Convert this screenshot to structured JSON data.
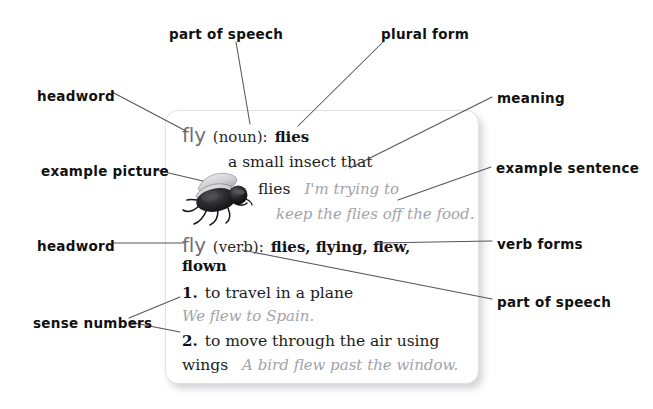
{
  "diagram": {
    "background_color": "#ffffff",
    "line_color": "#55555c"
  },
  "annotations": [
    {
      "id": "part-of-speech-top",
      "label": "part of speech",
      "x": 169,
      "y": 28
    },
    {
      "id": "plural-form",
      "label": "plural form",
      "x": 381,
      "y": 28
    },
    {
      "id": "headword-noun",
      "label": "headword",
      "x": 37,
      "y": 90
    },
    {
      "id": "meaning",
      "label": "meaning",
      "x": 497,
      "y": 92
    },
    {
      "id": "example-picture",
      "label": "example picture",
      "x": 41,
      "y": 165
    },
    {
      "id": "example-sentence",
      "label": "example sentence",
      "x": 496,
      "y": 162
    },
    {
      "id": "headword-verb",
      "label": "headword",
      "x": 37,
      "y": 240
    },
    {
      "id": "verb-forms",
      "label": "verb forms",
      "x": 497,
      "y": 238
    },
    {
      "id": "part-of-speech-right",
      "label": "part of speech",
      "x": 497,
      "y": 296
    },
    {
      "id": "sense-numbers",
      "label": "sense numbers",
      "x": 33,
      "y": 317
    }
  ],
  "leader_lines": [
    {
      "id": "line-part-of-speech-top",
      "from": "part of speech",
      "to": "(noun)",
      "x1": 236,
      "y1": 42,
      "x2": 250,
      "y2": 124
    },
    {
      "id": "line-plural-form",
      "from": "plural form",
      "to": "flies",
      "x1": 383,
      "y1": 42,
      "x2": 298,
      "y2": 126
    },
    {
      "id": "line-headword-noun",
      "from": "headword",
      "to": "fly",
      "x1": 112,
      "y1": 92,
      "x2": 186,
      "y2": 131
    },
    {
      "id": "line-meaning",
      "from": "meaning",
      "to": "a small insect that flies",
      "x1": 492,
      "y1": 97,
      "x2": 350,
      "y2": 168
    },
    {
      "id": "line-example-picture",
      "from": "example picture",
      "to": "fly photo",
      "x1": 156,
      "y1": 170,
      "x2": 203,
      "y2": 181
    },
    {
      "id": "line-example-sentence",
      "from": "example sentence",
      "to": "keep the flies off the food.",
      "x1": 491,
      "y1": 167,
      "x2": 398,
      "y2": 200
    },
    {
      "id": "line-headword-verb",
      "from": "headword",
      "to": "fly",
      "x1": 112,
      "y1": 243,
      "x2": 184,
      "y2": 243
    },
    {
      "id": "line-verb-forms",
      "from": "verb forms",
      "to": "flies, flying, flew, flown",
      "x1": 492,
      "y1": 241,
      "x2": 376,
      "y2": 243
    },
    {
      "id": "line-part-of-speech-right",
      "from": "part of speech",
      "to": "(verb)",
      "x1": 492,
      "y1": 299,
      "x2": 242,
      "y2": 250
    },
    {
      "id": "line-sense-numbers-1",
      "from": "sense numbers",
      "to": "1.",
      "x1": 129,
      "y1": 318,
      "x2": 180,
      "y2": 297
    },
    {
      "id": "line-sense-numbers-2",
      "from": "sense numbers",
      "to": "2.",
      "x1": 129,
      "y1": 322,
      "x2": 180,
      "y2": 332
    }
  ],
  "card": {
    "noun_entry": {
      "headword": "fly",
      "part_of_speech": "(noun):",
      "plural_form": "flies",
      "definition_line1": "a small insect that",
      "definition_line2": "flies",
      "example_line1": "I'm trying to",
      "example_line2": "keep the flies off the food.",
      "picture_alt": "housefly"
    },
    "verb_entry": {
      "headword": "fly",
      "part_of_speech": "(verb):",
      "forms_line1": "flies, flying, flew,",
      "forms_line2": "flown",
      "senses": [
        {
          "number": "1.",
          "definition": "to travel in a plane",
          "example": "We flew to Spain."
        },
        {
          "number": "2.",
          "definition": "to move through the air using",
          "definition_cont": "wings",
          "example": "A bird flew past the window."
        }
      ]
    }
  }
}
